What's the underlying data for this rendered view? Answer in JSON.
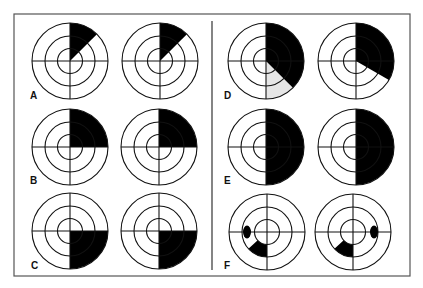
{
  "figure": {
    "width": 423,
    "height": 288,
    "frame": {
      "x": 14,
      "y": 14,
      "w": 396,
      "h": 262,
      "stroke": "#555555"
    },
    "divider": {
      "x": 212,
      "y1": 21,
      "y2": 270
    },
    "colors": {
      "ink": "#111111",
      "fill": "#000000",
      "shade": "#e6e6e6",
      "background": "#ffffff"
    },
    "ring_radii": [
      12.5,
      25,
      38
    ],
    "panels": [
      {
        "label": "A",
        "label_pos": [
          30,
          99
        ],
        "diagrams": [
          {
            "cx": 70,
            "cy": 61,
            "sectors": [
              {
                "start": 0,
                "end": 45,
                "r0": 0,
                "r1": 38,
                "color": "fill"
              }
            ]
          },
          {
            "cx": 160,
            "cy": 61,
            "sectors": [
              {
                "start": 0,
                "end": 45,
                "r0": 0,
                "r1": 38,
                "color": "fill"
              }
            ]
          }
        ]
      },
      {
        "label": "B",
        "label_pos": [
          30,
          184
        ],
        "diagrams": [
          {
            "cx": 70,
            "cy": 147,
            "sectors": [
              {
                "start": 0,
                "end": 90,
                "r0": 0,
                "r1": 38,
                "color": "fill"
              }
            ]
          },
          {
            "cx": 159,
            "cy": 147,
            "sectors": [
              {
                "start": 0,
                "end": 90,
                "r0": 0,
                "r1": 38,
                "color": "fill"
              }
            ]
          }
        ]
      },
      {
        "label": "C",
        "label_pos": [
          31,
          269
        ],
        "diagrams": [
          {
            "cx": 70,
            "cy": 231,
            "sectors": [
              {
                "start": 90,
                "end": 180,
                "r0": 0,
                "r1": 38,
                "color": "fill"
              }
            ]
          },
          {
            "cx": 159,
            "cy": 231,
            "sectors": [
              {
                "start": 90,
                "end": 180,
                "r0": 0,
                "r1": 38,
                "color": "fill"
              }
            ]
          }
        ]
      },
      {
        "label": "D",
        "label_pos": [
          224,
          99
        ],
        "diagrams": [
          {
            "cx": 266,
            "cy": 61,
            "sectors": [
              {
                "start": 135,
                "end": 180,
                "r0": 0,
                "r1": 38,
                "color": "shade"
              },
              {
                "start": 0,
                "end": 135,
                "r0": 0,
                "r1": 38,
                "color": "fill"
              }
            ]
          },
          {
            "cx": 356,
            "cy": 61,
            "sectors": [
              {
                "start": 0,
                "end": 120,
                "r0": 0,
                "r1": 38,
                "color": "fill"
              }
            ]
          }
        ]
      },
      {
        "label": "E",
        "label_pos": [
          224,
          184
        ],
        "diagrams": [
          {
            "cx": 266,
            "cy": 147,
            "sectors": [
              {
                "start": 0,
                "end": 180,
                "r0": 0,
                "r1": 38,
                "color": "fill"
              }
            ]
          },
          {
            "cx": 356,
            "cy": 147,
            "sectors": [
              {
                "start": 0,
                "end": 180,
                "r0": 0,
                "r1": 38,
                "color": "fill"
              }
            ]
          }
        ]
      },
      {
        "label": "F",
        "label_pos": [
          224,
          269
        ],
        "diagrams": [
          {
            "cx": 267,
            "cy": 232,
            "sectors": [
              {
                "start": 180,
                "end": 228,
                "r0": 12.5,
                "r1": 25,
                "color": "fill"
              }
            ],
            "blobs": [
              {
                "cx": 247,
                "cy": 232,
                "rx": 4,
                "ry": 6.5
              }
            ]
          },
          {
            "cx": 353,
            "cy": 232,
            "sectors": [
              {
                "start": 180,
                "end": 228,
                "r0": 12.5,
                "r1": 25,
                "color": "fill"
              }
            ],
            "blobs": [
              {
                "cx": 374,
                "cy": 232,
                "rx": 4,
                "ry": 6.5
              }
            ]
          }
        ]
      }
    ]
  }
}
